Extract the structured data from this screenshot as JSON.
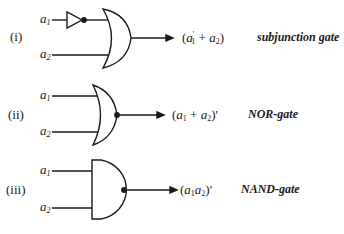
{
  "diagram": {
    "rows": [
      {
        "number": "(i)",
        "inputs": [
          "a1",
          "a2"
        ],
        "gate": "OR with inverted a1 input",
        "expression_parts": {
          "open": "(",
          "var1": "a",
          "sub1": "1",
          "prime1": "'",
          "op": " + ",
          "var2": "a",
          "sub2": "2",
          "close": ")"
        },
        "expression": "(a1' + a2)",
        "name": "subjunction gate"
      },
      {
        "number": "(ii)",
        "inputs": [
          "a1",
          "a2"
        ],
        "gate": "NOR",
        "expression_parts": {
          "open": "(",
          "var1": "a",
          "sub1": "1",
          "op": " + ",
          "var2": "a",
          "sub2": "2",
          "close": ")'"
        },
        "expression": "(a1 + a2)'",
        "name": "NOR-gate"
      },
      {
        "number": "(iii)",
        "inputs": [
          "a1",
          "a2"
        ],
        "gate": "NAND",
        "expression_parts": {
          "open": "(",
          "var1": "a",
          "sub1": "1",
          "var2": "a",
          "sub2": "2",
          "close": ")'"
        },
        "expression": "(a1a2)'",
        "name": "NAND-gate"
      }
    ],
    "input_label_var": "a",
    "input_sub": [
      "1",
      "2"
    ],
    "stroke_color": "#1a1a1a"
  }
}
